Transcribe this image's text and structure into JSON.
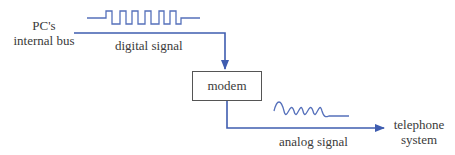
{
  "diagram": {
    "title": "",
    "colors": {
      "line": "#3f5db0",
      "box_border": "#555555",
      "text": "#3a3a3a",
      "background": "#ffffff"
    },
    "nodes": {
      "source": {
        "line1": "PC's",
        "line2": "internal bus"
      },
      "modem": {
        "label": "modem"
      },
      "destination": {
        "line1": "telephone",
        "line2": "system"
      }
    },
    "edges": {
      "input": {
        "label": "digital signal",
        "waveform": "square-wave"
      },
      "output": {
        "label": "analog signal",
        "waveform": "sine-wave"
      }
    }
  }
}
